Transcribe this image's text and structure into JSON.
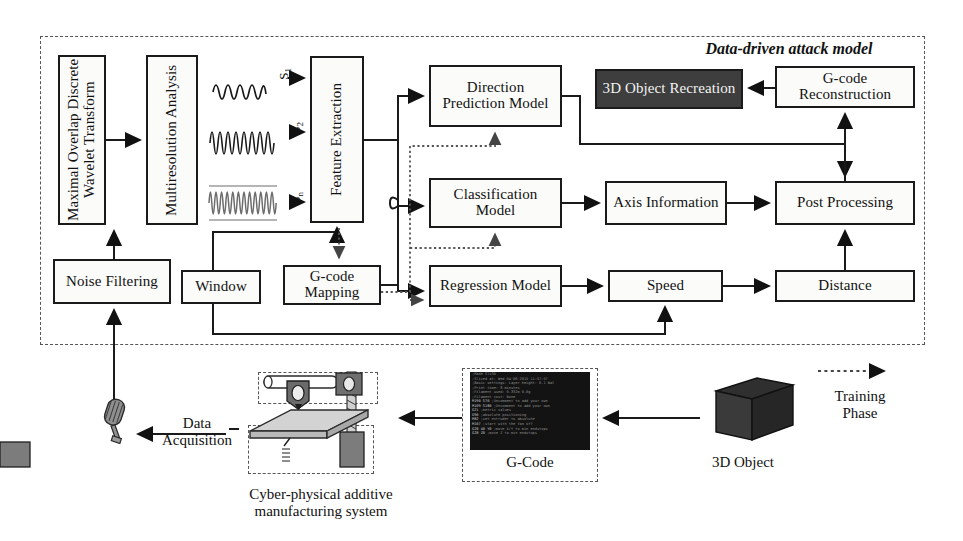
{
  "figure": {
    "attack_model_title": "Data-driven attack model",
    "training_phase_label": "Training Phase",
    "data_acquisition_label": "Data\nAcquisition",
    "printer_caption": "Cyber-physical additive\nmanufacturing system",
    "gcode_caption": "G-Code",
    "object_caption": "3D Object"
  },
  "blocks": {
    "modwt": "Maximal Overlap Discrete Wavelet Transform",
    "mra": "Multiresolution Analysis",
    "feature_extraction": "Feature Extraction",
    "direction_model": "Direction Prediction Model",
    "object_recreation": "3D Object Recreation",
    "gcode_reconstruction": "G-code Reconstruction",
    "classification_model": "Classification Model",
    "axis_information": "Axis Information",
    "post_processing": "Post Processing",
    "noise_filtering": "Noise Filtering",
    "window": "Window",
    "gcode_mapping": "G-code Mapping",
    "regression_model": "Regression Model",
    "speed": "Speed",
    "distance": "Distance"
  },
  "signals": [
    {
      "name": "signal-1",
      "label": "S",
      "index": "1"
    },
    {
      "name": "signal-2",
      "label": "S",
      "index": "2"
    },
    {
      "name": "signal-n",
      "label": "S",
      "index": "n"
    }
  ],
  "gcode_lines": [
    ";Made Sli3D",
    ";Sliced at: Wed 04-06-2015 11:57:57",
    ";Basic settings: Layer height: 0.1 Wal",
    ";Print time: 8 minutes",
    ";Filament used: 0.332m 0.0g",
    ";Filament cost: None",
    "M190 S70        ;Uncomment to add your own",
    "M109 S180       ;Uncomment to add your own",
    "G21             ;metric values",
    "G90             ;absolute positioning",
    "M82             ;set extruder to absolute",
    "M107            ;start with the fan off",
    "G28 X0 Y0       ;move X/Y to min endstops",
    "G28 Z0          ;move Z to min endstops"
  ],
  "colors": {
    "line": "#1a1a1a",
    "dashed_boundary": "#555555",
    "block_fill": "#fbfbfa",
    "dark_block_fill": "#3e3e3e",
    "dark_block_text": "#f2f2f2",
    "gcode_background": "#131313",
    "printer_gray": "#8d8d8d"
  }
}
